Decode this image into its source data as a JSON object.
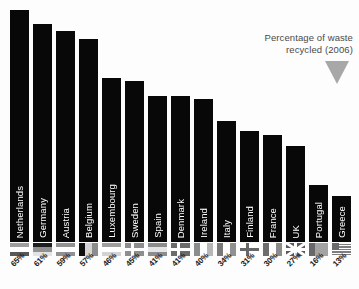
{
  "annotation": {
    "line1": "Percentage of waste",
    "line2": "recycled (2006)",
    "arrow_color": "#a8a8a8",
    "text_color": "#4a4a4a"
  },
  "style": {
    "bar_color": "#080808",
    "bar_label_color": "#ffffff",
    "background": "#fdfdfd"
  },
  "chart_data": {
    "type": "bar",
    "title": "Percentage of waste recycled (2006)",
    "xlabel": "",
    "ylabel": "",
    "ylim": [
      0,
      65
    ],
    "grid": false,
    "legend": "none",
    "value_suffix": "%",
    "orientation": "vertical",
    "categories": [
      "Netherlands",
      "Germany",
      "Austria",
      "Belgium",
      "Luxembourg",
      "Sweden",
      "Spain",
      "Denmark",
      "Ireland",
      "Italy",
      "Finland",
      "France",
      "UK",
      "Portugal",
      "Greece"
    ],
    "values": [
      65,
      61,
      59,
      57,
      46,
      45,
      41,
      41,
      40,
      34,
      31,
      30,
      27,
      16,
      13
    ],
    "value_labels": [
      "65%",
      "61%",
      "59%",
      "57%",
      "46%",
      "45%",
      "41%",
      "41%",
      "40%",
      "34%",
      "31%",
      "30%",
      "27%",
      "16%",
      "13%"
    ],
    "flags": [
      "flag-netherlands",
      "flag-germany",
      "flag-austria",
      "flag-belgium",
      "flag-luxembourg",
      "flag-sweden",
      "flag-spain",
      "flag-denmark",
      "flag-ireland",
      "flag-italy",
      "flag-finland",
      "flag-france",
      "flag-uk",
      "flag-portugal",
      "flag-greece"
    ]
  }
}
